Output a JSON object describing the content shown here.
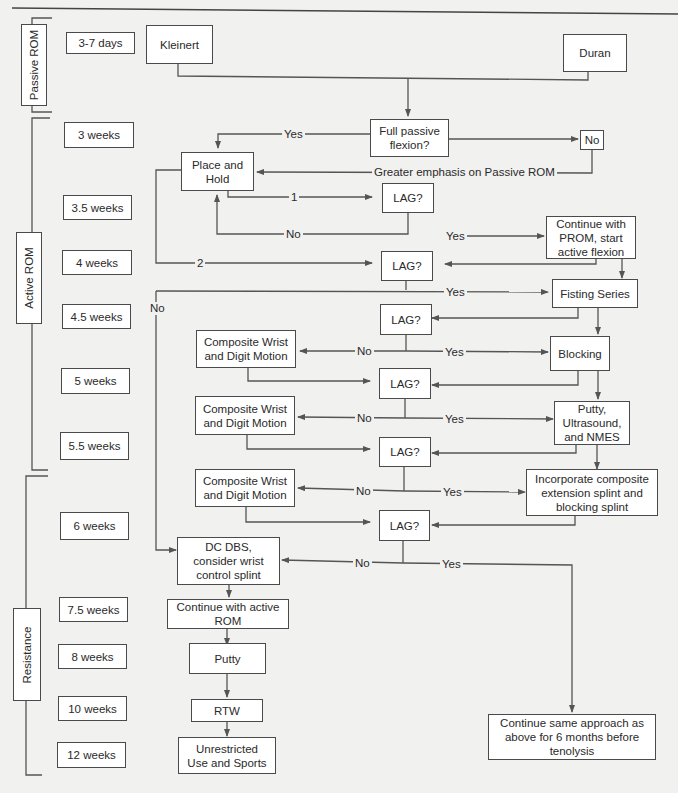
{
  "phases": {
    "passive": "Passive ROM",
    "active": "Active ROM",
    "resistance": "Resistance"
  },
  "timeline": [
    "3-7 days",
    "3 weeks",
    "3.5 weeks",
    "4 weeks",
    "4.5 weeks",
    "5 weeks",
    "5.5 weeks",
    "6 weeks",
    "7.5 weeks",
    "8 weeks",
    "10 weeks",
    "12 weeks"
  ],
  "nodes": {
    "kleinert": "Kleinert",
    "duran": "Duran",
    "full_passive": "Full passive\nflexion?",
    "no_box": "No",
    "place_hold": "Place and\nHold",
    "lag1": "LAG?",
    "continue_prom": "Continue with\nPROM, start\nactive flexion",
    "lag2": "LAG?",
    "fisting": "Fisting Series",
    "lag3": "LAG?",
    "composite1": "Composite Wrist\nand Digit Motion",
    "blocking": "Blocking",
    "lag4": "LAG?",
    "composite2": "Composite Wrist\nand Digit Motion",
    "putty_us": "Putty,\nUltrasound,\nand NMES",
    "lag5": "LAG?",
    "composite3": "Composite Wrist\nand Digit Motion",
    "incorporate": "Incorporate composite\nextension splint and\nblocking splint",
    "lag6": "LAG?",
    "dc_dbs": "DC DBS,\nconsider wrist\ncontrol splint",
    "continue_arom": "Continue with active\nROM",
    "putty": "Putty",
    "rtw": "RTW",
    "unrestricted": "Unrestricted\nUse and Sports",
    "continue_same": "Continue same approach as\nabove for 6 months before\ntenolysis"
  },
  "edge_labels": {
    "yes_fpf": "Yes",
    "greater_emphasis": "Greater emphasis on Passive ROM",
    "one": "1",
    "no_lag1": "No",
    "yes_lag1": "Yes",
    "two": "2",
    "yes_lag2": "Yes",
    "no_lag2": "No",
    "no_lag3": "No",
    "yes_lag3": "Yes",
    "no_lag4": "No",
    "yes_lag4": "Yes",
    "no_lag5": "No",
    "yes_lag5": "Yes",
    "no_lag6": "No",
    "yes_lag6": "Yes"
  },
  "colors": {
    "line": "#555555",
    "box_border": "#4a4a4a",
    "background": "#f1f1f0"
  }
}
